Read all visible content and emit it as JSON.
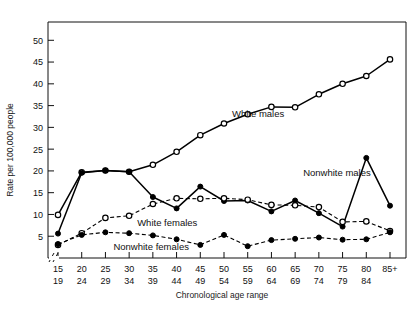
{
  "chart_data": {
    "type": "line",
    "title": "",
    "xlabel": "Chronological age range",
    "ylabel": "Rate per 100,000 people",
    "ylim": [
      0,
      54
    ],
    "yticks": [
      5,
      10,
      15,
      20,
      25,
      30,
      35,
      40,
      45,
      50
    ],
    "grid": false,
    "legend_position": "inline-annotations",
    "axis_break": "//",
    "categories": [
      "15\n19",
      "20\n24",
      "25\n29",
      "30\n34",
      "35\n39",
      "40\n44",
      "45\n49",
      "50\n54",
      "55\n59",
      "60\n64",
      "65\n69",
      "70\n74",
      "75\n79",
      "80\n84",
      "85+"
    ],
    "category_top": [
      "15",
      "20",
      "25",
      "30",
      "35",
      "40",
      "45",
      "50",
      "55",
      "60",
      "65",
      "70",
      "75",
      "80",
      "85+"
    ],
    "category_bottom": [
      "19",
      "24",
      "29",
      "34",
      "39",
      "44",
      "49",
      "54",
      "59",
      "64",
      "69",
      "74",
      "79",
      "84",
      ""
    ],
    "series": [
      {
        "name": "White males",
        "marker": "open-circle",
        "line": "solid",
        "color": "#000000",
        "values": [
          9.9,
          19.7,
          20.1,
          19.8,
          21.4,
          24.4,
          28.2,
          30.9,
          33.0,
          34.7,
          34.6,
          37.6,
          40.0,
          41.8,
          45.6
        ]
      },
      {
        "name": "Nonwhite males",
        "marker": "filled-circle",
        "line": "solid",
        "color": "#000000",
        "values": [
          5.6,
          19.6,
          20.1,
          19.8,
          14.0,
          11.4,
          16.4,
          13.1,
          13.2,
          10.7,
          13.2,
          10.3,
          7.2,
          23.0,
          12.0
        ]
      },
      {
        "name": "White females",
        "marker": "open-circle",
        "line": "dashed",
        "color": "#000000",
        "values": [
          3.0,
          5.7,
          9.2,
          9.7,
          12.4,
          13.7,
          13.6,
          13.7,
          13.4,
          12.2,
          12.1,
          11.7,
          8.3,
          8.4,
          6.2
        ]
      },
      {
        "name": "Nonwhite females",
        "marker": "filled-circle",
        "line": "dashed",
        "color": "#000000",
        "values": [
          3.2,
          5.3,
          5.9,
          5.7,
          5.2,
          4.3,
          3.0,
          5.3,
          2.7,
          4.1,
          4.4,
          4.7,
          4.2,
          4.3,
          5.9
        ]
      }
    ],
    "annotations": [
      {
        "name": "white-males-label",
        "text": "White males",
        "x_category": "50\n54",
        "value": 33.0
      },
      {
        "name": "nonwhite-males-label",
        "text": "Nonwhite males",
        "x_category": "65\n69",
        "value": 19.5
      },
      {
        "name": "white-females-label",
        "text": "White females",
        "x_category": "30\n34",
        "value": 8.0
      },
      {
        "name": "nonwhite-females-label",
        "text": "Nonwhite females",
        "x_category": "25\n29",
        "value": 2.6
      }
    ]
  },
  "axis": {
    "ylabel": "Rate per 100,000 people",
    "xlabel": "Chronological age range"
  }
}
